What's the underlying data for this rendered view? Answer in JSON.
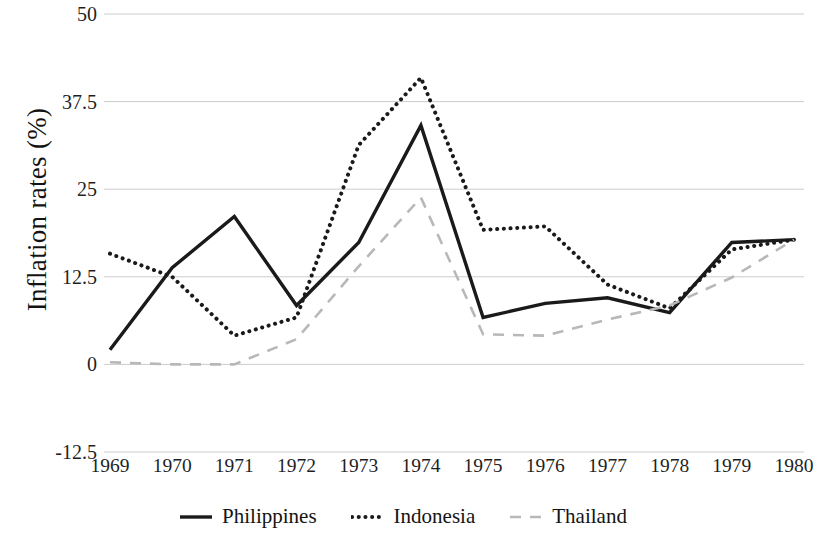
{
  "chart_data": {
    "type": "line",
    "title": "",
    "xlabel": "",
    "ylabel": "Inflation rates (%)",
    "categories": [
      "1969",
      "1970",
      "1971",
      "1972",
      "1973",
      "1974",
      "1975",
      "1976",
      "1977",
      "1978",
      "1979",
      "1980"
    ],
    "x": [
      1969,
      1970,
      1971,
      1972,
      1973,
      1974,
      1975,
      1976,
      1977,
      1978,
      1979,
      1980
    ],
    "ylim": [
      -12.5,
      50
    ],
    "yticks": [
      -12.5,
      0,
      12.5,
      25,
      37.5,
      50
    ],
    "ytick_labels": [
      "-12.5",
      "0",
      "12.5",
      "25",
      "37.5",
      "50"
    ],
    "grid": true,
    "legend_position": "bottom",
    "series": [
      {
        "name": "Philippines",
        "style": "solid",
        "color": "#1a1a1a",
        "values": [
          2.1,
          13.8,
          21.1,
          8.4,
          17.4,
          34.1,
          6.7,
          8.7,
          9.5,
          7.4,
          17.4,
          17.8
        ]
      },
      {
        "name": "Indonesia",
        "style": "dotted",
        "color": "#1a1a1a",
        "values": [
          15.8,
          12.5,
          4.1,
          6.7,
          31.3,
          40.9,
          19.2,
          19.7,
          11.4,
          8.0,
          16.4,
          17.8
        ]
      },
      {
        "name": "Thailand",
        "style": "dashed",
        "color": "#b8b8b8",
        "values": [
          0.3,
          0.0,
          0.0,
          3.6,
          14.0,
          23.8,
          4.3,
          4.1,
          6.4,
          8.4,
          12.4,
          17.8
        ]
      }
    ]
  },
  "legend": {
    "items": [
      {
        "label": "Philippines",
        "icon": "solid-line-icon"
      },
      {
        "label": "Indonesia",
        "icon": "dotted-line-icon"
      },
      {
        "label": "Thailand",
        "icon": "dashed-line-icon"
      }
    ]
  },
  "axis": {
    "y_title": "Inflation rates (%)"
  },
  "colors": {
    "gridline": "#cccccc",
    "philippines": "#1a1a1a",
    "indonesia": "#1a1a1a",
    "thailand": "#b8b8b8",
    "text": "#1a1a1a",
    "background": "#ffffff"
  }
}
